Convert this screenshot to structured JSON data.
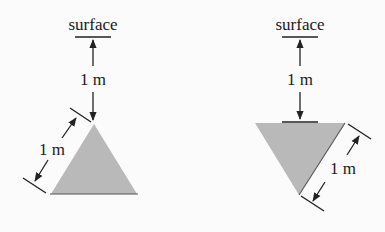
{
  "colors": {
    "line": "#222222",
    "fill": "#b9b9b9",
    "background": "#fbfbfb"
  },
  "figures": [
    {
      "id": "left",
      "orientation": "apex-up",
      "surface_label": "surface",
      "depth_label": "1 m",
      "side_label": "1 m"
    },
    {
      "id": "right",
      "orientation": "apex-down",
      "surface_label": "surface",
      "depth_label": "1 m",
      "side_label": "1 m"
    }
  ]
}
